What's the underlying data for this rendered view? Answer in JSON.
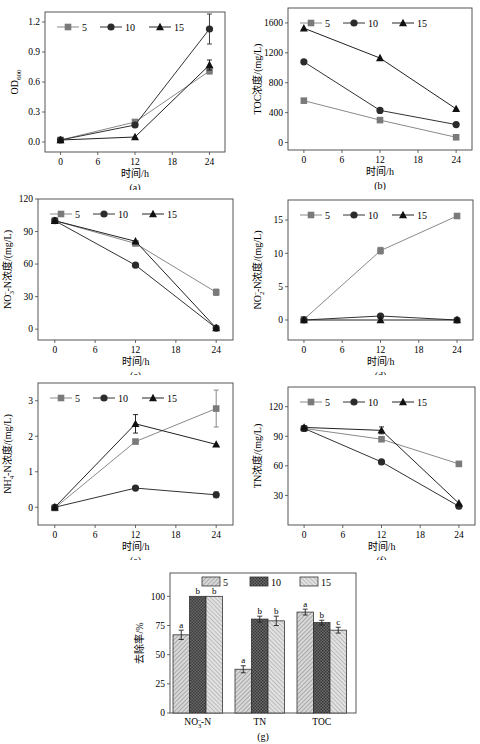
{
  "figure": {
    "legend_labels": [
      "5",
      "10",
      "15"
    ],
    "series_colors": {
      "5": "#7a7a7a",
      "10": "#2b2b2b",
      "15": "#111111"
    },
    "line_colors": {
      "5": "#8a8a8a",
      "10": "#333333",
      "15": "#222222"
    },
    "marker_shapes": {
      "5": "square",
      "10": "circle",
      "15": "triangle"
    }
  },
  "chart_data": [
    {
      "id": "a",
      "panel_label": "(a)",
      "type": "line",
      "title": "",
      "xlabel": "时间/h",
      "ylabel": "OD600",
      "ylabel_main": "OD",
      "ylabel_sub": "600",
      "x": [
        0,
        12,
        24
      ],
      "xticks": [
        0,
        6,
        12,
        18,
        24
      ],
      "xlim": [
        -2.5,
        26.5
      ],
      "yticks": [
        0.0,
        0.3,
        0.6,
        0.9,
        1.2
      ],
      "ytick_labels": [
        "0.0",
        "0.3",
        "0.6",
        "0.9",
        "1.2"
      ],
      "ylim": [
        -0.1,
        1.3
      ],
      "series": [
        {
          "name": "5",
          "values": [
            0.02,
            0.2,
            0.71
          ],
          "errors": [
            0.01,
            0.02,
            0.03
          ]
        },
        {
          "name": "10",
          "values": [
            0.02,
            0.17,
            1.13
          ],
          "errors": [
            0.01,
            0.02,
            0.15
          ]
        },
        {
          "name": "15",
          "values": [
            0.02,
            0.05,
            0.77
          ],
          "errors": [
            0.01,
            0.01,
            0.05
          ]
        }
      ],
      "legend_position": "top"
    },
    {
      "id": "b",
      "panel_label": "(b)",
      "type": "line",
      "title": "",
      "xlabel": "时间/h",
      "ylabel": "TOC浓度/(mg/L)",
      "x": [
        0,
        12,
        24
      ],
      "xticks": [
        0,
        6,
        12,
        18,
        24
      ],
      "xlim": [
        -2.5,
        26.5
      ],
      "yticks": [
        0,
        400,
        800,
        1200,
        1600
      ],
      "ytick_labels": [
        "0",
        "400",
        "800",
        "1200",
        "1600"
      ],
      "ylim": [
        -100,
        1800
      ],
      "series": [
        {
          "name": "5",
          "values": [
            560,
            300,
            70
          ],
          "errors": [
            20,
            15,
            10
          ]
        },
        {
          "name": "10",
          "values": [
            1080,
            430,
            240
          ],
          "errors": [
            20,
            15,
            10
          ]
        },
        {
          "name": "15",
          "values": [
            1530,
            1130,
            450
          ],
          "errors": [
            20,
            20,
            15
          ]
        }
      ],
      "legend_position": "top"
    },
    {
      "id": "c",
      "panel_label": "(c)",
      "type": "line",
      "title": "",
      "xlabel": "时间/h",
      "ylabel": "NO3–-N浓度/(mg/L)",
      "x": [
        0,
        12,
        24
      ],
      "xticks": [
        0,
        6,
        12,
        18,
        24
      ],
      "xlim": [
        -2.5,
        26.5
      ],
      "yticks": [
        0,
        30,
        60,
        90,
        120
      ],
      "ytick_labels": [
        "0",
        "30",
        "60",
        "90",
        "120"
      ],
      "ylim": [
        -10,
        120
      ],
      "series": [
        {
          "name": "5",
          "values": [
            100,
            79,
            34
          ],
          "errors": [
            1,
            1.5,
            3
          ]
        },
        {
          "name": "10",
          "values": [
            100,
            59,
            1
          ],
          "errors": [
            1,
            1,
            0.5
          ]
        },
        {
          "name": "15",
          "values": [
            100,
            81,
            1
          ],
          "errors": [
            1,
            1,
            0.5
          ]
        }
      ],
      "legend_position": "top"
    },
    {
      "id": "d",
      "panel_label": "(d)",
      "type": "line",
      "title": "",
      "xlabel": "时间/h",
      "ylabel": "NO2–-N浓度/(mg/L)",
      "x": [
        0,
        12,
        24
      ],
      "xticks": [
        0,
        6,
        12,
        18,
        24
      ],
      "xlim": [
        -2.5,
        26.5
      ],
      "yticks": [
        0,
        5,
        10,
        15
      ],
      "ytick_labels": [
        "0",
        "5",
        "10",
        "15"
      ],
      "ylim": [
        -3,
        18
      ],
      "series": [
        {
          "name": "5",
          "values": [
            0.1,
            10.4,
            15.6
          ],
          "errors": [
            0.1,
            0.5,
            0.2
          ]
        },
        {
          "name": "10",
          "values": [
            0.0,
            0.6,
            0.0
          ],
          "errors": [
            0.05,
            0.2,
            0.05
          ]
        },
        {
          "name": "15",
          "values": [
            0.0,
            0.0,
            0.0
          ],
          "errors": [
            0.05,
            0.1,
            0.05
          ]
        }
      ],
      "legend_position": "top"
    },
    {
      "id": "e",
      "panel_label": "(e)",
      "type": "line",
      "title": "",
      "xlabel": "时间/h",
      "ylabel": "NH4+-N浓度/(mg/L)",
      "x": [
        0,
        12,
        24
      ],
      "xticks": [
        0,
        6,
        12,
        18,
        24
      ],
      "xlim": [
        -2.5,
        26.5
      ],
      "yticks": [
        0,
        1,
        2,
        3
      ],
      "ytick_labels": [
        "0",
        "1",
        "2",
        "3"
      ],
      "ylim": [
        -0.5,
        3.5
      ],
      "series": [
        {
          "name": "5",
          "values": [
            -0.02,
            1.85,
            2.78
          ],
          "errors": [
            0.02,
            0.05,
            0.52
          ]
        },
        {
          "name": "10",
          "values": [
            0.0,
            0.54,
            0.35
          ],
          "errors": [
            0.02,
            0.04,
            0.08
          ]
        },
        {
          "name": "15",
          "values": [
            0.0,
            2.35,
            1.77
          ],
          "errors": [
            0.02,
            0.26,
            0.06
          ]
        }
      ],
      "legend_position": "top"
    },
    {
      "id": "f",
      "panel_label": "(f)",
      "type": "line",
      "title": "",
      "xlabel": "时间/h",
      "ylabel": "TN浓度/(mg/L)",
      "x": [
        0,
        12,
        24
      ],
      "xticks": [
        0,
        6,
        12,
        18,
        24
      ],
      "xlim": [
        -2.5,
        26.5
      ],
      "yticks": [
        30,
        60,
        90,
        120
      ],
      "ytick_labels": [
        "30",
        "60",
        "90",
        "120"
      ],
      "ylim": [
        0,
        140
      ],
      "series": [
        {
          "name": "5",
          "values": [
            98,
            87,
            62
          ],
          "errors": [
            1.5,
            2,
            1.5
          ]
        },
        {
          "name": "10",
          "values": [
            98,
            64,
            19
          ],
          "errors": [
            1.5,
            2.5,
            2
          ]
        },
        {
          "name": "15",
          "values": [
            99,
            96,
            22
          ],
          "errors": [
            1.5,
            3.5,
            2.5
          ]
        }
      ],
      "legend_position": "top"
    },
    {
      "id": "g",
      "panel_label": "(g)",
      "type": "bar",
      "title": "",
      "xlabel": "",
      "ylabel": "去除率/%",
      "categories": [
        "NO3–-N",
        "TN",
        "TOC"
      ],
      "yticks": [
        0,
        25,
        50,
        75,
        100
      ],
      "ytick_labels": [
        "0",
        "25",
        "50",
        "75",
        "100"
      ],
      "ylim": [
        0,
        120
      ],
      "series": [
        {
          "name": "5",
          "values": [
            67,
            37.5,
            86.5
          ],
          "errors": [
            4,
            3,
            2.5
          ],
          "letters": [
            "a",
            "a",
            "a"
          ]
        },
        {
          "name": "10",
          "values": [
            100,
            80.5,
            77.5
          ],
          "errors": [
            0,
            2.5,
            2
          ],
          "letters": [
            "b",
            "b",
            "b"
          ]
        },
        {
          "name": "15",
          "values": [
            100,
            79,
            71
          ],
          "errors": [
            0,
            4,
            2.5
          ],
          "letters": [
            "b",
            "b",
            "c"
          ]
        }
      ],
      "legend_position": "top"
    }
  ]
}
